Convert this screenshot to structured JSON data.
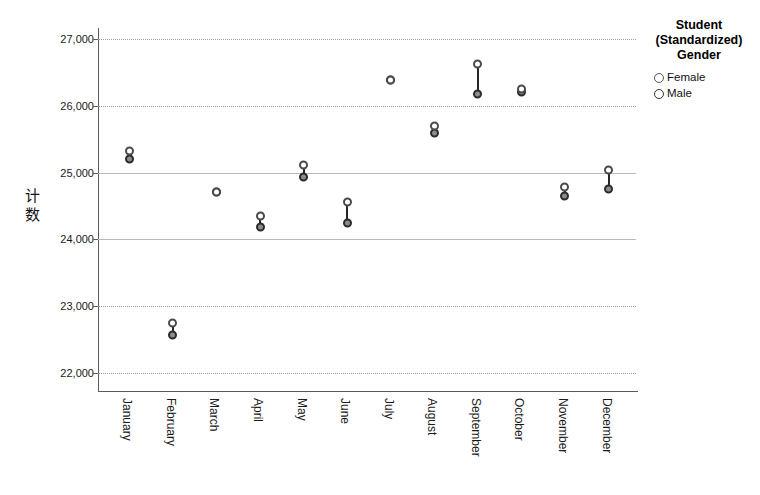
{
  "chart_data": {
    "type": "scatter",
    "title": "",
    "xlabel": "",
    "ylabel": "计数",
    "ylim": [
      21700,
      27300
    ],
    "yticks": [
      22000,
      23000,
      24000,
      25000,
      26000,
      27000
    ],
    "ytick_labels": [
      "22,000",
      "23,000",
      "24,000",
      "25,000",
      "26,000",
      "27,000"
    ],
    "grid": true,
    "legend_position": "right",
    "categories": [
      "January",
      "February",
      "March",
      "April",
      "May",
      "June",
      "July",
      "August",
      "September",
      "October",
      "November",
      "December"
    ],
    "series": [
      {
        "name": "Female",
        "marker": "open-circle",
        "values": [
          25330,
          22750,
          24710,
          24350,
          25120,
          24560,
          26380,
          25700,
          26630,
          26250,
          24780,
          25040
        ]
      },
      {
        "name": "Male",
        "marker": "filled-circle",
        "values": [
          25200,
          22570,
          24710,
          24180,
          24930,
          24240,
          26380,
          25600,
          26170,
          26200,
          24650,
          24760
        ]
      }
    ]
  },
  "legend": {
    "title_lines": [
      "Student",
      "(Standardized)",
      "Gender"
    ],
    "items": [
      {
        "label": "Female"
      },
      {
        "label": "Male"
      }
    ]
  },
  "colors": {
    "female_marker": "#ffffff",
    "male_marker": "#8c8c8c",
    "drop_line": "#262626",
    "gridline": "#9aa0a6",
    "axis": "#5a5a5a",
    "background": "#ffffff"
  }
}
